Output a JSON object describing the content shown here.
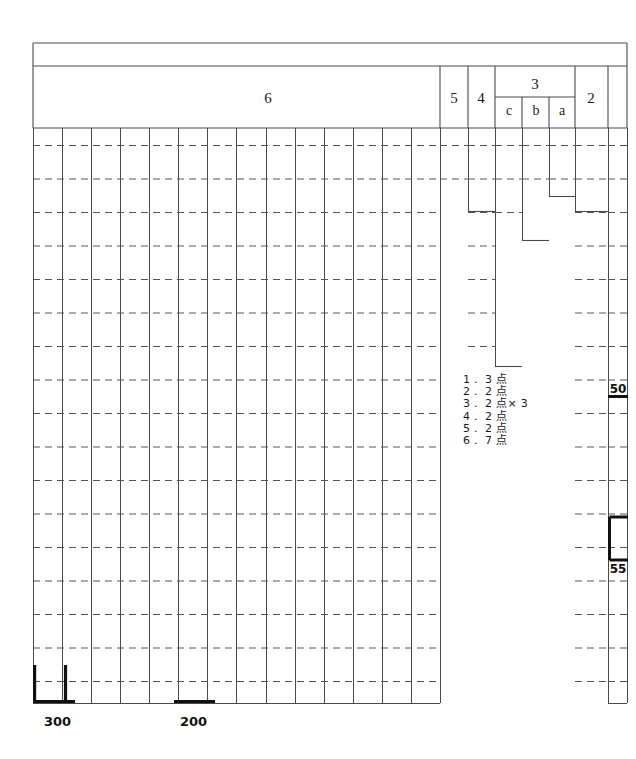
{
  "chart_data": {
    "type": "table",
    "title": "",
    "header_groups": [
      {
        "label": "6",
        "x": 33,
        "width": 407,
        "subcolumns": []
      },
      {
        "label": "5",
        "x": 440,
        "width": 28,
        "subcolumns": []
      },
      {
        "label": "4",
        "x": 468,
        "width": 27,
        "subcolumns": []
      },
      {
        "label": "3",
        "x": 495,
        "width": 80,
        "subcolumns": [
          "c",
          "b",
          "a"
        ]
      },
      {
        "label": "2",
        "x": 575,
        "width": 33,
        "subcolumns": []
      }
    ],
    "subcolumn_labels": [
      "c",
      "b",
      "a"
    ],
    "grid": {
      "left": 33,
      "right": 627,
      "top": 43,
      "bottom": 703,
      "header_thin_row_bottom": 66,
      "header_bottom": 128,
      "column_width": 29.07,
      "main_columns": 14,
      "dashed_row_spacing": 33.5,
      "dashed_rows": 17
    },
    "markers": [
      {
        "name": "bracket-300",
        "label": "300",
        "type": "bracket-up",
        "x": 33,
        "width": 33,
        "y": 703
      },
      {
        "name": "bracket-200",
        "label": "200",
        "type": "underline",
        "x": 178,
        "width": 33,
        "y": 703
      },
      {
        "name": "bracket-50",
        "label": "50",
        "type": "hline",
        "x": 608,
        "width": 28,
        "y": 396
      },
      {
        "name": "bracket-55",
        "label": "55",
        "type": "bracket-down",
        "x": 608,
        "width": 28,
        "y": 517,
        "height": 43
      }
    ],
    "legend": {
      "x": 463,
      "y": 383,
      "items": [
        {
          "index": "1",
          "value": "3 点"
        },
        {
          "index": "2",
          "value": "2 点"
        },
        {
          "index": "3",
          "value": "2 点× 3"
        },
        {
          "index": "4",
          "value": "2 点"
        },
        {
          "index": "5",
          "value": "2 点"
        },
        {
          "index": "6",
          "value": "7 点"
        }
      ]
    },
    "colors": {
      "line": "#4a4a4a",
      "dash": "#555555",
      "thick": "#111111",
      "background": "#ffffff"
    }
  }
}
